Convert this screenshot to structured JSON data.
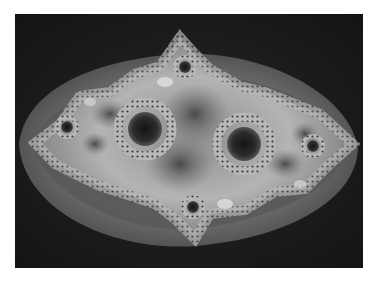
{
  "image": {
    "subject": "grayscale fractal (Julia set)",
    "colors": {
      "page_background": "#ffffff",
      "frame_background": "#1c1c1c",
      "outer_band": "#5a5a5a",
      "inner_band": "#8a8a8a",
      "fractal_light": "#d8d8d8",
      "fractal_mid": "#9a9a9a",
      "fractal_dark": "#2a2a2a"
    }
  }
}
